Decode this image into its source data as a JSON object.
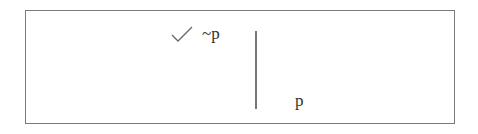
{
  "diagram": {
    "type": "truth-tree",
    "nodes": [
      {
        "id": "n1",
        "formula": "~p",
        "checked": true
      },
      {
        "id": "n2",
        "formula": "p"
      }
    ],
    "edges": [
      {
        "from": "n1",
        "to": "n2",
        "style": "vertical-line"
      }
    ],
    "check_mark_glyph": "check-icon",
    "colors": {
      "border": "#7a7a7a",
      "line": "#777777",
      "text": "#333333"
    }
  }
}
